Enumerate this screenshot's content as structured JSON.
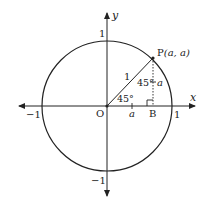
{
  "diagram": {
    "axes": {
      "x_label": "x",
      "y_label": "y",
      "origin_label": "O",
      "x_ticks": [
        {
          "label": "−1",
          "value": -1
        },
        {
          "label": "1",
          "value": 1
        }
      ],
      "y_ticks": [
        {
          "label": "1",
          "value": 1
        },
        {
          "label": "−1",
          "value": -1
        }
      ]
    },
    "circle": {
      "radius": 1,
      "center": "O"
    },
    "point_p": {
      "label": "P",
      "coords": "(a, a)"
    },
    "point_b": {
      "label": "B"
    },
    "segment_op_label": "1",
    "angle_at_o": "45°",
    "angle_at_p": "45°",
    "segment_pb_label": "a",
    "segment_ob_tick_label": "a",
    "right_angle_marker": "at B",
    "colors": {
      "stroke": "#222222",
      "background": "#ffffff"
    }
  }
}
